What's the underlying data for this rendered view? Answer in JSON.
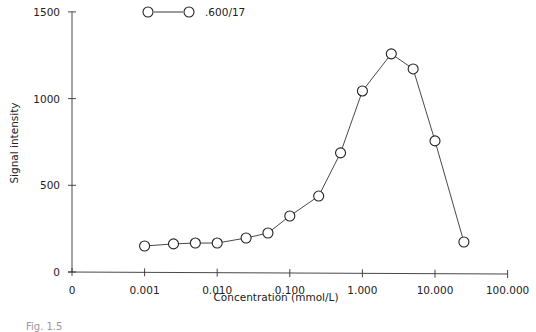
{
  "chart_data": {
    "type": "line",
    "title": "",
    "xlabel": "Concentration (mmol/L)",
    "ylabel": "Signal intensity",
    "x_scale": "log",
    "x_tick_labels": [
      "0",
      "0.001",
      "0.010",
      "0.100",
      "1.000",
      "10.000",
      "100.000"
    ],
    "x_tick_values": [
      0,
      0.001,
      0.01,
      0.1,
      1,
      10,
      100
    ],
    "y_tick_labels": [
      "0",
      "500",
      "1000",
      "1500"
    ],
    "y_tick_values": [
      0,
      500,
      1000,
      1500
    ],
    "ylim": [
      0,
      1500
    ],
    "xlim": [
      0.0001,
      100
    ],
    "grid": false,
    "legend_position": "top-center",
    "series": [
      {
        "name": ".600/17",
        "marker": "open-circle",
        "x": [
          0.001,
          0.0025,
          0.005,
          0.01,
          0.025,
          0.05,
          0.1,
          0.25,
          0.5,
          1.0,
          2.5,
          5.0,
          10.0,
          25.0
        ],
        "values": [
          150,
          162,
          167,
          167,
          196,
          225,
          323,
          438,
          687,
          1044,
          1258,
          1171,
          756,
          173
        ]
      }
    ],
    "caption": "Fig. 1.5"
  },
  "legend": {
    "label": ".600/17"
  },
  "axes": {
    "xlabel": "Concentration (mmol/L)",
    "ylabel": "Signal intensity"
  },
  "caption": "Fig. 1.5"
}
